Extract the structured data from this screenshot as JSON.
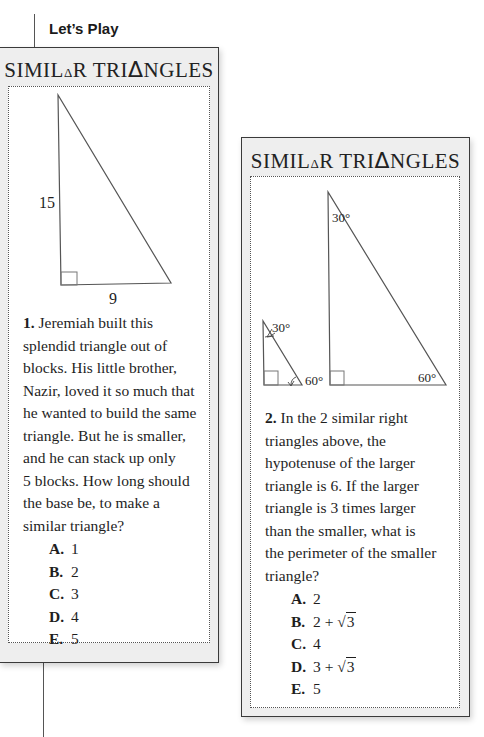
{
  "page": {
    "section_label": "Let’s Play"
  },
  "cards": [
    {
      "title_parts": [
        "SIMIL",
        "Δ",
        "R TRI",
        "Δ",
        "NGLES"
      ],
      "figure": {
        "labels": {
          "vertical_leg": "15",
          "base": "9"
        }
      },
      "question": {
        "number": "1.",
        "text": "Jeremiah built this splendid triangle out of blocks. His little brother, Nazir, loved it so much that he wanted to build the same triangle. But he is smaller, and he can stack up only 5 blocks. How long should the base be, to make a similar triangle?",
        "lines": [
          "Jeremiah built this",
          "splendid triangle out of",
          "blocks. His little brother,",
          "Nazir, loved it so much that",
          "he wanted to build the same",
          "triangle. But he is smaller,",
          "and he can stack up only",
          "5 blocks. How long should",
          "the base be, to make a",
          "similar triangle?"
        ]
      },
      "choices": [
        {
          "letter": "A.",
          "value": "1"
        },
        {
          "letter": "B.",
          "value": "2"
        },
        {
          "letter": "C.",
          "value": "3"
        },
        {
          "letter": "D.",
          "value": "4"
        },
        {
          "letter": "E.",
          "value": "5"
        }
      ]
    },
    {
      "title_parts": [
        "SIMIL",
        "Δ",
        "R TRI",
        "Δ",
        "NGLES"
      ],
      "figure": {
        "small_triangle": {
          "top_angle": "30°",
          "bottom_angle": "60°"
        },
        "large_triangle": {
          "top_angle": "30°",
          "bottom_angle": "60°"
        }
      },
      "question": {
        "number": "2.",
        "text": "In the 2 similar right triangles above, the hypotenuse of the larger triangle is 6. If the larger triangle is 3 times larger than the smaller, what is the perimeter of the smaller triangle?",
        "lines": [
          "In the 2 similar right",
          "triangles above, the",
          "hypotenuse of the larger",
          "triangle is 6. If the larger",
          "triangle is 3 times larger",
          "than the smaller, what is",
          "the perimeter of the smaller",
          "triangle?"
        ]
      },
      "choices": [
        {
          "letter": "A.",
          "value": "2"
        },
        {
          "letter": "B.",
          "value_prefix": "2 + ",
          "radical": "√",
          "radicand": "3"
        },
        {
          "letter": "C.",
          "value": "4"
        },
        {
          "letter": "D.",
          "value_prefix": "3 + ",
          "radical": "√",
          "radicand": "3"
        },
        {
          "letter": "E.",
          "value": "5"
        }
      ]
    }
  ]
}
